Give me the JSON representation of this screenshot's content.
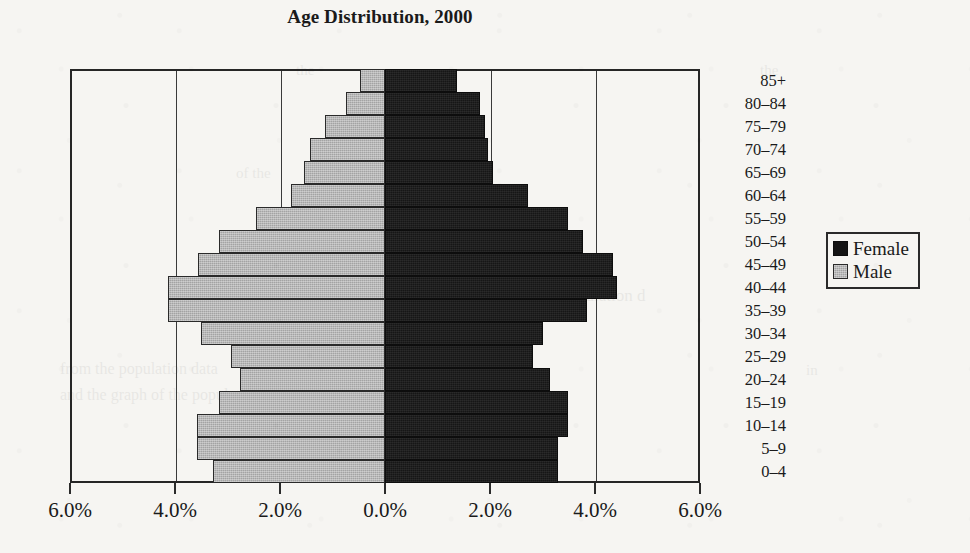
{
  "chart_data": {
    "type": "bar",
    "title": "Age Distribution, 2000",
    "subtype": "population-pyramid",
    "xlabel": "",
    "ylabel": "",
    "orientation": "horizontal",
    "grid": true,
    "legend_position": "right",
    "xlim": [
      -6.0,
      6.0
    ],
    "xticks": [
      -6.0,
      -4.0,
      -2.0,
      0.0,
      2.0,
      4.0,
      6.0
    ],
    "xtick_labels": [
      "6.0%",
      "4.0%",
      "2.0%",
      "0.0%",
      "2.0%",
      "4.0%",
      "6.0%"
    ],
    "categories": [
      "0–4",
      "5–9",
      "10–14",
      "15–19",
      "20–24",
      "25–29",
      "30–34",
      "35–39",
      "40–44",
      "45–49",
      "50–54",
      "55–59",
      "60–64",
      "65–69",
      "70–74",
      "75–79",
      "80–84",
      "85+"
    ],
    "series": [
      {
        "name": "Male",
        "side": "left",
        "color": "#a3a3a3",
        "values": [
          3.28,
          3.58,
          3.58,
          3.16,
          2.76,
          2.94,
          3.51,
          4.13,
          4.13,
          3.56,
          3.16,
          2.46,
          1.79,
          1.54,
          1.43,
          1.14,
          0.74,
          0.48
        ]
      },
      {
        "name": "Female",
        "side": "right",
        "color": "#141414",
        "values": [
          3.3,
          3.3,
          3.49,
          3.49,
          3.14,
          2.82,
          3.01,
          3.85,
          4.42,
          4.34,
          3.77,
          3.49,
          2.72,
          2.06,
          1.96,
          1.9,
          1.81,
          1.37
        ]
      }
    ]
  },
  "legend": {
    "entries": [
      {
        "label": "Female",
        "swatch": "female-swatch"
      },
      {
        "label": "Male",
        "swatch": "male-swatch"
      }
    ]
  },
  "page_bleed": [
    {
      "text": "the",
      "left": 296,
      "top": 62,
      "size": 15
    },
    {
      "text": "of the",
      "left": 236,
      "top": 165,
      "size": 15
    },
    {
      "text": "calculated",
      "left": 430,
      "top": 286,
      "size": 17
    },
    {
      "text": "population d",
      "left": 560,
      "top": 286,
      "size": 17
    },
    {
      "text": "from the population data",
      "left": 60,
      "top": 360,
      "size": 16
    },
    {
      "text": "and the graph of the population",
      "left": 60,
      "top": 386,
      "size": 16
    },
    {
      "text": "the",
      "left": 760,
      "top": 62,
      "size": 15
    },
    {
      "text": "in",
      "left": 806,
      "top": 362,
      "size": 15
    }
  ]
}
